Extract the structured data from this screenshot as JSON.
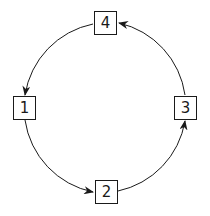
{
  "diagram": {
    "type": "cycle",
    "nodes": [
      {
        "id": "1",
        "label": "1"
      },
      {
        "id": "2",
        "label": "2"
      },
      {
        "id": "3",
        "label": "3"
      },
      {
        "id": "4",
        "label": "4"
      }
    ],
    "edges": [
      {
        "from": "1",
        "to": "2"
      },
      {
        "from": "2",
        "to": "3"
      },
      {
        "from": "3",
        "to": "4"
      },
      {
        "from": "4",
        "to": "1"
      }
    ],
    "colors": {
      "stroke": "#1a1a1a",
      "background": "#ffffff"
    }
  }
}
